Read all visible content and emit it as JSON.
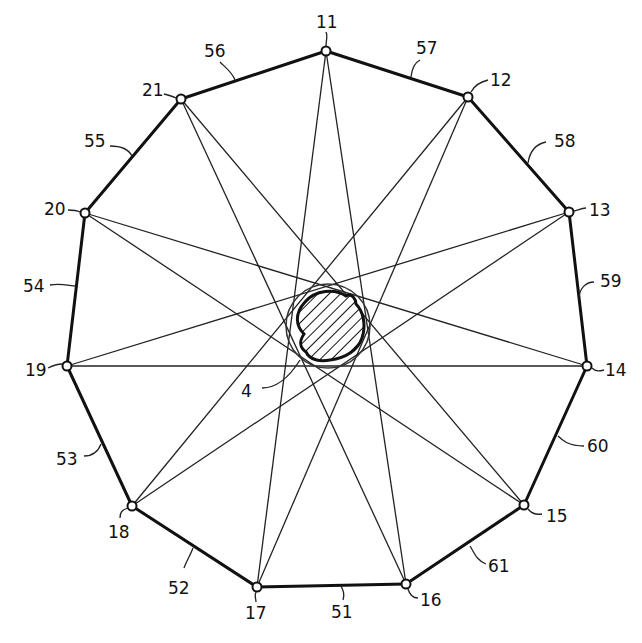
{
  "figure": {
    "nodes": [
      {
        "id": "11",
        "x": 326,
        "y": 51,
        "label": "11"
      },
      {
        "id": "12",
        "x": 468,
        "y": 97,
        "label": "12"
      },
      {
        "id": "13",
        "x": 569,
        "y": 212,
        "label": "13"
      },
      {
        "id": "14",
        "x": 587,
        "y": 366,
        "label": "14"
      },
      {
        "id": "15",
        "x": 524,
        "y": 505,
        "label": "15"
      },
      {
        "id": "16",
        "x": 406,
        "y": 584,
        "label": "16"
      },
      {
        "id": "17",
        "x": 257,
        "y": 587,
        "label": "17"
      },
      {
        "id": "18",
        "x": 132,
        "y": 506,
        "label": "18"
      },
      {
        "id": "19",
        "x": 67,
        "y": 366,
        "label": "19"
      },
      {
        "id": "20",
        "x": 85,
        "y": 213,
        "label": "20"
      },
      {
        "id": "21",
        "x": 181,
        "y": 99,
        "label": "21"
      }
    ],
    "edges": [
      {
        "from": "11",
        "to": "12",
        "label": "57"
      },
      {
        "from": "12",
        "to": "13",
        "label": "58"
      },
      {
        "from": "13",
        "to": "14",
        "label": "59"
      },
      {
        "from": "14",
        "to": "15",
        "label": "60"
      },
      {
        "from": "15",
        "to": "16",
        "label": "61"
      },
      {
        "from": "16",
        "to": "17",
        "label": "51"
      },
      {
        "from": "17",
        "to": "18",
        "label": "52"
      },
      {
        "from": "18",
        "to": "19",
        "label": "53"
      },
      {
        "from": "19",
        "to": "20",
        "label": "54"
      },
      {
        "from": "20",
        "to": "21",
        "label": "55"
      },
      {
        "from": "21",
        "to": "11",
        "label": "56"
      }
    ],
    "chords": [
      [
        "11",
        "16"
      ],
      [
        "11",
        "17"
      ],
      [
        "12",
        "17"
      ],
      [
        "12",
        "18"
      ],
      [
        "13",
        "18"
      ],
      [
        "13",
        "19"
      ],
      [
        "14",
        "19"
      ],
      [
        "14",
        "20"
      ],
      [
        "15",
        "20"
      ],
      [
        "15",
        "21"
      ],
      [
        "16",
        "21"
      ]
    ],
    "center_object": {
      "label": "4"
    }
  },
  "labels": {
    "n11": "11",
    "n12": "12",
    "n13": "13",
    "n14": "14",
    "n15": "15",
    "n16": "16",
    "n17": "17",
    "n18": "18",
    "n19": "19",
    "n20": "20",
    "n21": "21",
    "e51": "51",
    "e52": "52",
    "e53": "53",
    "e54": "54",
    "e55": "55",
    "e56": "56",
    "e57": "57",
    "e58": "58",
    "e59": "59",
    "e60": "60",
    "e61": "61",
    "obj4": "4"
  }
}
